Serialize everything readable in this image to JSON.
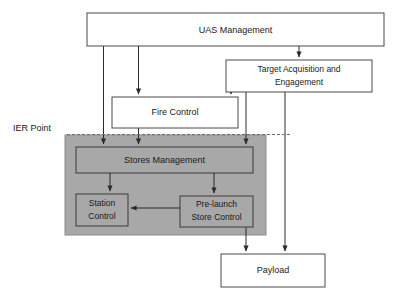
{
  "diagram": {
    "canvas": {
      "width": 396,
      "height": 296,
      "background": "#ffffff"
    },
    "colors": {
      "region_fill": "#a8a8a8",
      "node_fill_white": "#ffffff",
      "node_stroke": "#4a4a4a",
      "edge": "#2b2b2b",
      "dashed_line": "#6d6d6d",
      "text": "#1a1a1a"
    },
    "annotations": [
      {
        "id": "ier-point",
        "label": "IER Point",
        "kind": "boundary-marker",
        "dashed": true
      }
    ],
    "region": {
      "id": "ier-region",
      "label": "",
      "fill": "#a8a8a8"
    },
    "nodes": [
      {
        "id": "uas-management",
        "label": "UAS Management",
        "lines": [
          "UAS Management"
        ],
        "fill": "white",
        "x": 87,
        "y": 13,
        "w": 297,
        "h": 33
      },
      {
        "id": "target-acquisition-and-engagement",
        "label": "Target Acquisition and Engagement",
        "lines": [
          "Target Acquisition and",
          "Engagement"
        ],
        "fill": "white",
        "x": 226,
        "y": 60,
        "w": 146,
        "h": 32
      },
      {
        "id": "fire-control",
        "label": "Fire Control",
        "lines": [
          "Fire Control"
        ],
        "fill": "white",
        "x": 112,
        "y": 97,
        "w": 126,
        "h": 31
      },
      {
        "id": "stores-management",
        "label": "Stores Management",
        "lines": [
          "Stores Management"
        ],
        "fill": "gray",
        "x": 76,
        "y": 147,
        "w": 177,
        "h": 26
      },
      {
        "id": "station-control",
        "label": "Station Control",
        "lines": [
          "Station",
          "Control"
        ],
        "fill": "gray",
        "x": 76,
        "y": 194,
        "w": 52,
        "h": 32
      },
      {
        "id": "pre-launch-store-control",
        "label": "Pre-launch Store Control",
        "lines": [
          "Pre-launch",
          "Store Control"
        ],
        "fill": "gray",
        "x": 180,
        "y": 196,
        "w": 73,
        "h": 31
      },
      {
        "id": "payload",
        "label": "Payload",
        "lines": [
          "Payload"
        ],
        "fill": "white",
        "x": 221,
        "y": 254,
        "w": 104,
        "h": 33
      }
    ],
    "edges": [
      {
        "id": "uas-to-stores",
        "from": "uas-management",
        "to": "stores-management",
        "arrow": true
      },
      {
        "id": "uas-to-fire-control",
        "from": "uas-management",
        "to": "fire-control",
        "arrow": true
      },
      {
        "id": "uas-to-target-acquisition",
        "from": "uas-management",
        "to": "target-acquisition-and-engagement",
        "arrow": true
      },
      {
        "id": "fire-control-to-stores",
        "from": "fire-control",
        "to": "stores-management",
        "arrow": true
      },
      {
        "id": "target-acquisition-to-fire-control",
        "from": "target-acquisition-and-engagement",
        "to": "fire-control",
        "arrow": true
      },
      {
        "id": "target-acquisition-to-stores",
        "from": "target-acquisition-and-engagement",
        "to": "stores-management",
        "arrow": true
      },
      {
        "id": "target-acquisition-to-payload",
        "from": "target-acquisition-and-engagement",
        "to": "payload",
        "arrow": true
      },
      {
        "id": "stores-to-station-control",
        "from": "stores-management",
        "to": "station-control",
        "arrow": true
      },
      {
        "id": "stores-to-pre-launch",
        "from": "stores-management",
        "to": "pre-launch-store-control",
        "arrow": true
      },
      {
        "id": "pre-launch-to-station-control",
        "from": "pre-launch-store-control",
        "to": "station-control",
        "arrow": true
      },
      {
        "id": "pre-launch-to-payload",
        "from": "pre-launch-store-control",
        "to": "payload",
        "arrow": true
      }
    ]
  }
}
